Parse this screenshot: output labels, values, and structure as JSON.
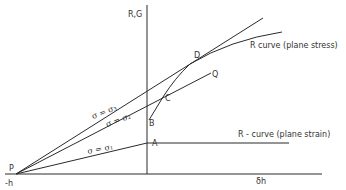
{
  "figure": {
    "axes": {
      "y_label": "R,G",
      "x_label": "δh",
      "origin_label": "-h"
    },
    "points": {
      "P": "P",
      "A": "A",
      "B": "B",
      "C": "C",
      "D": "D",
      "Q": "Q"
    },
    "lines": {
      "sigma1": "σ = σ₁",
      "sigma2": "σ = σ₂",
      "sigma3": "σ = σ₃"
    },
    "curves": {
      "plane_stress": "R curve (plane stress)",
      "plane_strain": "R - curve (plane strain)"
    },
    "colors": {
      "line": "#2a2a2a",
      "text": "#333333",
      "background": "#ffffff"
    }
  }
}
